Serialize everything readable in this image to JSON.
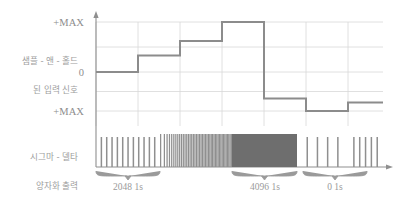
{
  "figure": {
    "kind": "sigma-delta-adc-timing-diagram",
    "background": "#ffffff",
    "grid_color": "#d8d8d8",
    "axis_color": "#8f8f8f",
    "trace_color": "#8c8c8c",
    "pulse_color": "#8f8f8f",
    "block_color": "#6e6e6e",
    "text_color": "#9a9a9a"
  },
  "axis": {
    "y_labels": [
      {
        "text": "+MAX",
        "value": "positive-max"
      },
      {
        "text": "0",
        "value": "zero"
      },
      {
        "text": "+MAX",
        "value": "negative-max"
      }
    ]
  },
  "row_labels": [
    {
      "line1": "샘플 - 앤 - 홀드",
      "line2": "된 입력 신호",
      "name": "sample-and-hold-input-signal"
    },
    {
      "line1": "시그마 - 델타",
      "line2": "양자화 출력",
      "name": "sigma-delta-quantizer-output"
    }
  ],
  "braces": [
    {
      "label": "2048 1s",
      "x_center": 128,
      "x_start": 96,
      "x_end": 160
    },
    {
      "label": "4096 1s",
      "x_center": 265,
      "x_start": 232,
      "x_end": 297
    },
    {
      "label": "0 1s",
      "x_center": 335,
      "x_start": 303,
      "x_end": 367
    }
  ],
  "chart_data": {
    "type": "line",
    "title": "",
    "xlabel": "",
    "ylabel": "",
    "ylim": [
      -1,
      1
    ],
    "grid": true,
    "legend_position": "none",
    "y_tick_labels": [
      "+MAX",
      "0",
      "+MAX"
    ],
    "y_tick_values": [
      1,
      0,
      -1
    ],
    "x_gridlines": [
      96,
      138,
      180,
      222,
      264,
      306,
      348
    ],
    "y_gridlines": [
      1,
      0.5,
      0,
      -0.5,
      -1
    ],
    "staircase_signal": {
      "name": "sample-and-hold-input-signal",
      "steps": [
        {
          "x_start": 96,
          "x_end": 138,
          "level": 0.0
        },
        {
          "x_start": 138,
          "x_end": 180,
          "level": 0.33
        },
        {
          "x_start": 180,
          "x_end": 222,
          "level": 0.62
        },
        {
          "x_start": 222,
          "x_end": 264,
          "level": 1.0
        },
        {
          "x_start": 264,
          "x_end": 306,
          "level": -0.68
        },
        {
          "x_start": 306,
          "x_end": 348,
          "level": -1.0
        },
        {
          "x_start": 348,
          "x_end": 383,
          "level": -0.78
        }
      ]
    },
    "quantizer_output": {
      "name": "sigma-delta-quantizer-output",
      "description": "1-bit pulse density modulated output; density increases with input level",
      "segments": [
        {
          "x_start": 96,
          "x_end": 160,
          "ones": 2048,
          "mode": "sparse",
          "pulse_count": 11
        },
        {
          "x_start": 160,
          "x_end": 232,
          "ones": 3072,
          "mode": "dense",
          "pulse_count": 44
        },
        {
          "x_start": 232,
          "x_end": 297,
          "ones": 4096,
          "mode": "solid",
          "pulse_count": 0
        },
        {
          "x_start": 297,
          "x_end": 348,
          "ones": 0,
          "mode": "sparse",
          "pulse_count": 4
        },
        {
          "x_start": 348,
          "x_end": 383,
          "ones": 0,
          "mode": "sparse",
          "pulse_count": 5
        }
      ]
    }
  }
}
